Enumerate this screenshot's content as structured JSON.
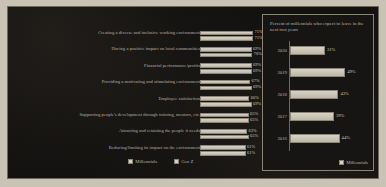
{
  "chart_data": [
    {
      "type": "bar",
      "orientation": "horizontal",
      "title": "",
      "xlabel": "",
      "ylabel": "",
      "xlim": [
        0,
        75
      ],
      "grid": false,
      "legend_position": "bottom",
      "categories": [
        "Creating a diverse and inclusive working environment",
        "Having a positive impact on local communities",
        "Financial performance/profits",
        "Providing a motivating and stimulating environment",
        "Employee satisfaction",
        "Supporting people's development through training, mentors, etc.",
        "Attracting and retaining the people it needs",
        "Reducing/limiting its impact on the environment"
      ],
      "series": [
        {
          "name": "Millennials",
          "values": [
            71,
            69,
            69,
            67,
            66,
            65,
            63,
            61
          ]
        },
        {
          "name": "Gen Z",
          "values": [
            71,
            70,
            69,
            69,
            69,
            65,
            65,
            61
          ]
        }
      ],
      "value_labels": [
        {
          "millennials": "71%",
          "genz": "71%"
        },
        {
          "millennials": "69%",
          "genz": "70%"
        },
        {
          "millennials": "69%",
          "genz": "69%"
        },
        {
          "millennials": "67%",
          "genz": "69%"
        },
        {
          "millennials": "66%",
          "genz": "69%"
        },
        {
          "millennials": "65%",
          "genz": "65%"
        },
        {
          "millennials": "63%",
          "genz": "65%"
        },
        {
          "millennials": "61%",
          "genz": "61%"
        }
      ],
      "legend": [
        "Millennials",
        "Gen Z"
      ]
    },
    {
      "type": "bar",
      "orientation": "horizontal",
      "title": "Percent of millennials who expect to leave in the next two years",
      "xlabel": "",
      "ylabel": "",
      "xlim": [
        0,
        55
      ],
      "grid": false,
      "legend_position": "bottom-right",
      "categories": [
        "2020",
        "2019",
        "2018",
        "2017",
        "2016"
      ],
      "values": [
        31,
        49,
        43,
        39,
        44
      ],
      "value_labels": [
        "31%",
        "49%",
        "43%",
        "39%",
        "44%"
      ],
      "legend": [
        "Millennials"
      ]
    }
  ],
  "left_chart": {
    "rows": [
      {
        "label": "Creating a diverse and inclusive working environment",
        "m": "71%",
        "g": "71%",
        "mv": 71,
        "gv": 71
      },
      {
        "label": "Having a positive impact on local communities",
        "m": "69%",
        "g": "70%",
        "mv": 69,
        "gv": 70
      },
      {
        "label": "Financial performance/profits",
        "m": "69%",
        "g": "69%",
        "mv": 69,
        "gv": 69
      },
      {
        "label": "Providing a motivating and stimulating environment",
        "m": "67%",
        "g": "69%",
        "mv": 67,
        "gv": 69
      },
      {
        "label": "Employee satisfaction",
        "m": "66%",
        "g": "69%",
        "mv": 66,
        "gv": 69
      },
      {
        "label": "Supporting people's development through training, mentors, etc.",
        "m": "65%",
        "g": "65%",
        "mv": 65,
        "gv": 65
      },
      {
        "label": "Attracting and retaining the people it needs",
        "m": "63%",
        "g": "65%",
        "mv": 63,
        "gv": 65
      },
      {
        "label": "Reducing/limiting its impact on the environment",
        "m": "61%",
        "g": "61%",
        "mv": 61,
        "gv": 61
      }
    ],
    "legend": [
      {
        "label": "Millennials"
      },
      {
        "label": "Gen Z"
      }
    ]
  },
  "right_chart": {
    "title": "Percent of millennials who expect to leave in the next two years",
    "rows": [
      {
        "year": "2020",
        "label": "31%",
        "value": 31
      },
      {
        "year": "2019",
        "label": "49%",
        "value": 49
      },
      {
        "year": "2018",
        "label": "43%",
        "value": 43
      },
      {
        "year": "2017",
        "label": "39%",
        "value": 39
      },
      {
        "year": "2016",
        "label": "44%",
        "value": 44
      }
    ],
    "legend": [
      {
        "label": "Millennials"
      }
    ]
  },
  "colors": {
    "background": "#141210",
    "bar_fill": "#d2ccbf",
    "text": "#b9b2a2",
    "border": "#8a8478"
  }
}
